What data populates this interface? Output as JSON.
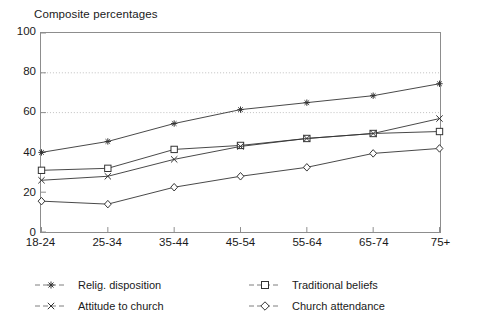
{
  "chart_data": {
    "type": "line",
    "title": "Composite percentages",
    "xlabel": "",
    "ylabel": "",
    "ylim": [
      0,
      100
    ],
    "yticks": [
      0,
      20,
      40,
      60,
      80,
      100
    ],
    "grid": "horizontal dotted gridlines at 60 and 80",
    "gridlines": [
      60,
      80
    ],
    "legend_position": "below-plot-two-columns",
    "categories": [
      "18-24",
      "25-34",
      "35-44",
      "45-54",
      "55-64",
      "65-74",
      "75+"
    ],
    "series": [
      {
        "name": "Relig. disposition",
        "marker": "star",
        "color": "#333333",
        "values": [
          40,
          45.5,
          54.5,
          61.5,
          65,
          68.5,
          74.5
        ]
      },
      {
        "name": "Traditional beliefs",
        "marker": "square",
        "color": "#333333",
        "values": [
          31,
          32,
          41.5,
          43.5,
          47,
          49.5,
          50.5
        ]
      },
      {
        "name": "Attitude to church",
        "marker": "x",
        "color": "#333333",
        "values": [
          26,
          28,
          36.5,
          43,
          47,
          49.5,
          57
        ]
      },
      {
        "name": "Church attendance",
        "marker": "diamond",
        "color": "#333333",
        "values": [
          15.5,
          14,
          22.5,
          28,
          32.5,
          39.5,
          42
        ]
      }
    ]
  },
  "legend": {
    "items": [
      {
        "label": "Relig. disposition",
        "marker": "star-marker-icon"
      },
      {
        "label": "Attitude to church",
        "marker": "x-marker-icon"
      },
      {
        "label": "Traditional beliefs",
        "marker": "square-marker-icon"
      },
      {
        "label": "Church attendance",
        "marker": "diamond-marker-icon"
      }
    ]
  },
  "colors": {
    "axis": "#8d8d8d",
    "line": "#4a4a4a",
    "grid": "#b0b0b0",
    "text": "#1a1a1a",
    "background": "#ffffff"
  }
}
